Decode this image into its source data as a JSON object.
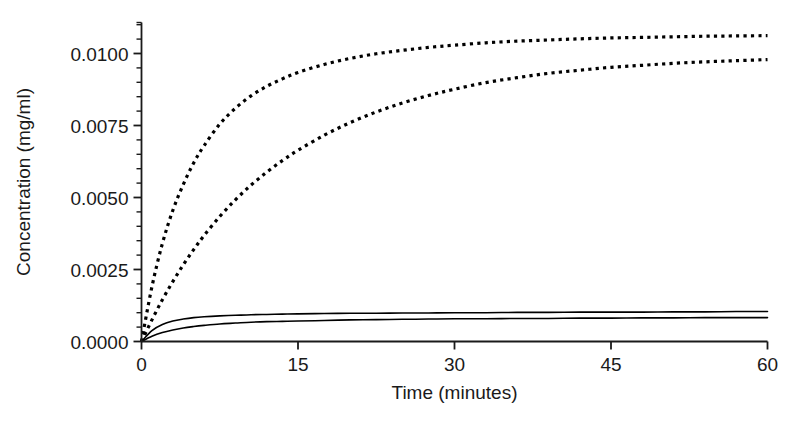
{
  "chart_data": {
    "type": "line",
    "title": "",
    "xlabel": "Time (minutes)",
    "ylabel": "Concentration (mg/ml)",
    "xlim": [
      0,
      60
    ],
    "ylim": [
      0,
      0.0115
    ],
    "grid": false,
    "legend": "none",
    "xticks": [
      0,
      15,
      30,
      45,
      60
    ],
    "xtick_labels": [
      "0",
      "15",
      "30",
      "45",
      "60"
    ],
    "yticks": [
      0.0,
      0.0025,
      0.005,
      0.0075,
      0.01
    ],
    "ytick_labels": [
      "0.0000",
      "0.0025",
      "0.0050",
      "0.0075",
      "0.0100"
    ],
    "yminor_step": 0.0005,
    "x": [
      0,
      1,
      2,
      3,
      4,
      5,
      6,
      7.5,
      9,
      10.5,
      12,
      13.5,
      15,
      17.5,
      20,
      22.5,
      25,
      27.5,
      30,
      33,
      36,
      39,
      42,
      45,
      48,
      51,
      54,
      57,
      60
    ],
    "series": [
      {
        "name": "upper-dotted",
        "style": "dotted",
        "color": "#000000",
        "values": [
          0.0,
          0.0019,
          0.0034,
          0.00455,
          0.00545,
          0.0062,
          0.0068,
          0.00755,
          0.0081,
          0.00853,
          0.00886,
          0.00912,
          0.00934,
          0.00962,
          0.00983,
          0.00999,
          0.01011,
          0.01021,
          0.01029,
          0.01037,
          0.01043,
          0.01047,
          0.01051,
          0.01054,
          0.01056,
          0.01058,
          0.0106,
          0.01061,
          0.01062
        ]
      },
      {
        "name": "lower-dotted",
        "style": "dotted",
        "color": "#000000",
        "values": [
          0.0,
          0.00075,
          0.00145,
          0.00208,
          0.00266,
          0.00319,
          0.00368,
          0.00434,
          0.00492,
          0.00543,
          0.00588,
          0.00628,
          0.00664,
          0.00716,
          0.0076,
          0.00797,
          0.00828,
          0.00854,
          0.00876,
          0.00899,
          0.00916,
          0.00931,
          0.00942,
          0.00952,
          0.00959,
          0.00966,
          0.00971,
          0.00975,
          0.00979
        ]
      },
      {
        "name": "upper-solid",
        "style": "solid",
        "color": "#000000",
        "values": [
          0.0,
          0.00038,
          0.00059,
          0.00071,
          0.00078,
          0.00083,
          0.00086,
          0.00089,
          0.00091,
          0.00093,
          0.00094,
          0.00095,
          0.00096,
          0.00097,
          0.00098,
          0.00098,
          0.00099,
          0.00099,
          0.001,
          0.001,
          0.00101,
          0.00101,
          0.00102,
          0.00102,
          0.00102,
          0.00103,
          0.00103,
          0.00104,
          0.00104
        ]
      },
      {
        "name": "lower-solid",
        "style": "solid",
        "color": "#000000",
        "values": [
          0.0,
          0.00018,
          0.00031,
          0.0004,
          0.00047,
          0.00052,
          0.00056,
          0.00061,
          0.00064,
          0.00067,
          0.00069,
          0.0007,
          0.00071,
          0.00073,
          0.00075,
          0.00076,
          0.00077,
          0.00078,
          0.00079,
          0.00079,
          0.0008,
          0.0008,
          0.00081,
          0.00081,
          0.00082,
          0.00082,
          0.00083,
          0.00083,
          0.00083
        ]
      }
    ]
  },
  "axes": {
    "line_color": "#1a1a1a"
  }
}
